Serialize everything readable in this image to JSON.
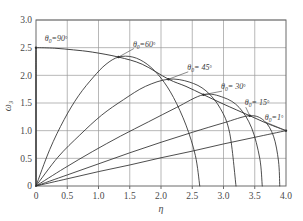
{
  "chart_data": {
    "type": "line",
    "title": "",
    "subtitle": "",
    "xlabel": "η",
    "ylabel": "ω₃",
    "xlim": [
      0,
      4.0
    ],
    "ylim": [
      0,
      3.0
    ],
    "xticks": [
      "0",
      "0.5",
      "1.0",
      "1.5",
      "2.0",
      "2.5",
      "3.0",
      "3.5",
      "4.0"
    ],
    "xtick_values": [
      0,
      0.5,
      1.0,
      1.5,
      2.0,
      2.5,
      3.0,
      3.5,
      4.0
    ],
    "yticks": [
      "0",
      "0.5",
      "1.0",
      "1.5",
      "2.0",
      "2.5",
      "3.0"
    ],
    "ytick_values": [
      0,
      0.5,
      1.0,
      1.5,
      2.0,
      2.5,
      3.0
    ],
    "grid": true,
    "legend_position": "inline-annotations",
    "series": [
      {
        "name": "θ₀=90°",
        "angle_deg": 90,
        "label": "θ",
        "label_sub": "0",
        "label_rest": "=90",
        "label_deg": "°",
        "label_x": 0.14,
        "label_y": 2.62,
        "apex": [
          0.0,
          2.5
        ],
        "end": [
          0.0,
          0.0
        ],
        "points": [
          [
            0,
            0
          ],
          [
            0,
            0.5
          ],
          [
            0,
            1.0
          ],
          [
            0,
            1.5
          ],
          [
            0,
            2.0
          ],
          [
            0,
            2.5
          ],
          [
            0,
            2.0
          ],
          [
            0,
            1.5
          ],
          [
            0,
            1.0
          ],
          [
            0,
            0.5
          ],
          [
            0,
            0
          ]
        ]
      },
      {
        "name": "θ₀=60°",
        "angle_deg": 60,
        "label": "θ",
        "label_sub": "0",
        "label_rest": "=60",
        "label_deg": "°",
        "label_x": 1.55,
        "label_y": 2.52,
        "apex": [
          1.32,
          2.33
        ],
        "end": [
          2.62,
          0.0
        ],
        "points": [
          [
            0,
            0
          ],
          [
            0.22,
            0.66
          ],
          [
            0.45,
            1.2
          ],
          [
            0.68,
            1.63
          ],
          [
            0.92,
            1.97
          ],
          [
            1.12,
            2.2
          ],
          [
            1.32,
            2.33
          ],
          [
            1.55,
            2.33
          ],
          [
            1.78,
            2.2
          ],
          [
            2.0,
            1.95
          ],
          [
            2.2,
            1.6
          ],
          [
            2.4,
            1.1
          ],
          [
            2.55,
            0.55
          ],
          [
            2.62,
            0
          ]
        ]
      },
      {
        "name": "θ₀=45°",
        "angle_deg": 45,
        "label": "θ",
        "label_sub": "0",
        "label_rest": "= 45",
        "label_deg": "°",
        "label_x": 2.42,
        "label_y": 2.1,
        "apex": [
          2.12,
          1.93
        ],
        "end": [
          3.2,
          0.0
        ],
        "points": [
          [
            0,
            0
          ],
          [
            0.35,
            0.52
          ],
          [
            0.7,
            0.92
          ],
          [
            1.05,
            1.28
          ],
          [
            1.4,
            1.56
          ],
          [
            1.75,
            1.8
          ],
          [
            2.12,
            1.93
          ],
          [
            2.45,
            1.88
          ],
          [
            2.72,
            1.72
          ],
          [
            2.95,
            1.4
          ],
          [
            3.1,
            0.95
          ],
          [
            3.2,
            0
          ]
        ]
      },
      {
        "name": "θ₀=30°",
        "angle_deg": 30,
        "label": "θ",
        "label_sub": "0",
        "label_rest": "= 30",
        "label_deg": "°",
        "label_x": 2.96,
        "label_y": 1.75,
        "apex": [
          2.68,
          1.65
        ],
        "end": [
          3.62,
          0.0
        ],
        "points": [
          [
            0,
            0
          ],
          [
            0.45,
            0.32
          ],
          [
            0.9,
            0.62
          ],
          [
            1.35,
            0.9
          ],
          [
            1.8,
            1.16
          ],
          [
            2.25,
            1.42
          ],
          [
            2.68,
            1.65
          ],
          [
            3.0,
            1.6
          ],
          [
            3.25,
            1.42
          ],
          [
            3.45,
            1.05
          ],
          [
            3.58,
            0.5
          ],
          [
            3.62,
            0
          ]
        ]
      },
      {
        "name": "θ₀= 15°",
        "angle_deg": 15,
        "label": "θ",
        "label_sub": "0",
        "label_rest": "= 15",
        "label_deg": "°",
        "label_x": 3.34,
        "label_y": 1.46,
        "apex": [
          3.42,
          1.27
        ],
        "end": [
          3.9,
          0.0
        ],
        "points": [
          [
            0,
            0
          ],
          [
            0.5,
            0.2
          ],
          [
            1.0,
            0.4
          ],
          [
            1.5,
            0.6
          ],
          [
            2.0,
            0.79
          ],
          [
            2.5,
            0.97
          ],
          [
            3.0,
            1.14
          ],
          [
            3.42,
            1.27
          ],
          [
            3.65,
            1.18
          ],
          [
            3.8,
            0.9
          ],
          [
            3.88,
            0.45
          ],
          [
            3.9,
            0
          ]
        ]
      },
      {
        "name": "θ₀=1°",
        "angle_deg": 1,
        "label": "θ",
        "label_sub": "0",
        "label_rest": "=1",
        "label_deg": "°",
        "label_x": 3.66,
        "label_y": 1.19,
        "apex": [
          4.0,
          1.0
        ],
        "end": [
          4.0,
          0.95
        ],
        "points": [
          [
            0,
            0
          ],
          [
            0.5,
            0.13
          ],
          [
            1.0,
            0.26
          ],
          [
            1.5,
            0.38
          ],
          [
            2.0,
            0.51
          ],
          [
            2.5,
            0.63
          ],
          [
            3.0,
            0.76
          ],
          [
            3.5,
            0.88
          ],
          [
            4.0,
            1.0
          ]
        ]
      }
    ],
    "envelope": {
      "name": "apex-envelope",
      "points": [
        [
          0,
          2.5
        ],
        [
          0.3,
          2.49
        ],
        [
          0.6,
          2.46
        ],
        [
          0.9,
          2.42
        ],
        [
          1.32,
          2.33
        ],
        [
          1.7,
          2.2
        ],
        [
          2.12,
          1.93
        ],
        [
          2.4,
          1.8
        ],
        [
          2.68,
          1.65
        ],
        [
          3.0,
          1.48
        ],
        [
          3.42,
          1.27
        ],
        [
          3.7,
          1.13
        ],
        [
          4.0,
          1.0
        ]
      ]
    }
  }
}
